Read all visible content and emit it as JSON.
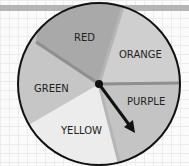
{
  "spinner": {
    "sections": [
      {
        "label": "RED",
        "color": "#a9a9a9"
      },
      {
        "label": "ORANGE",
        "color": "#cfcfcf"
      },
      {
        "label": "PURPLE",
        "color": "#c4c4c4"
      },
      {
        "label": "YELLOW",
        "color": "#ececec"
      },
      {
        "label": "GREEN",
        "color": "#c6c6c6"
      }
    ],
    "arrow_pointing_to": "PURPLE"
  }
}
